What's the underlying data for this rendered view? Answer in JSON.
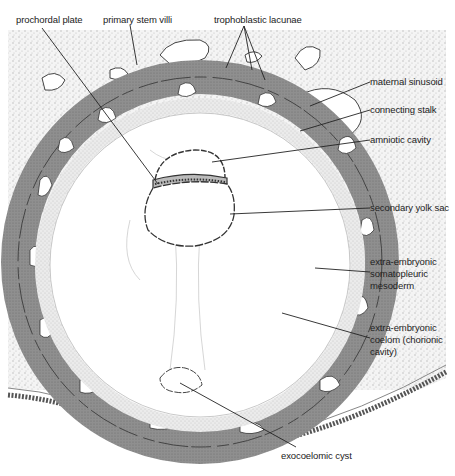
{
  "diagram": {
    "colors": {
      "endometrium_stipple": "#d9d9d9",
      "trophoblast_dark": "#8a8a8a",
      "mesoderm_light": "#e6e6e6",
      "outline": "#333333",
      "background": "#ffffff"
    },
    "labels": {
      "prochordal_plate": "prochordal plate",
      "primary_stem_villi": "primary stem villi",
      "trophoblastic_lacunae": "trophoblastic lacunae",
      "maternal_sinusoid": "maternal sinusoid",
      "connecting_stalk": "connecting stalk",
      "amniotic_cavity": "amniotic cavity",
      "secondary_yolk_sac": "secondary yolk sac",
      "extra_embryonic_somatopleuric_mesoderm_1": "extra-embryonic",
      "extra_embryonic_somatopleuric_mesoderm_2": "somatopleuric",
      "extra_embryonic_somatopleuric_mesoderm_3": "mesoderm",
      "extra_embryonic_coelom_1": "extra-embryonic",
      "extra_embryonic_coelom_2": "coelom (chorionic",
      "extra_embryonic_coelom_3": "cavity)",
      "exocoelomic_cyst": "exocoelomic cyst"
    }
  }
}
